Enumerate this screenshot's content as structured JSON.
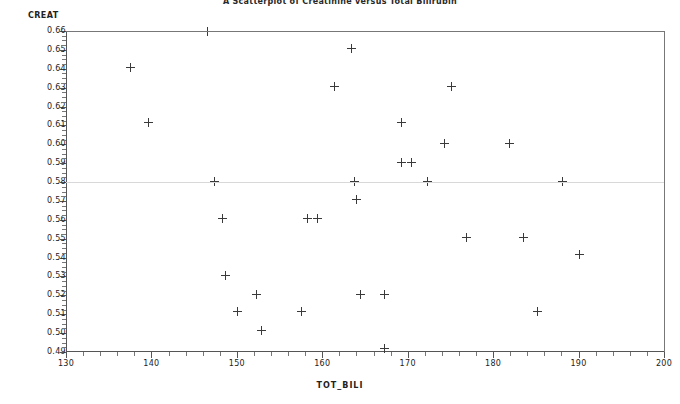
{
  "chart_data": {
    "type": "scatter",
    "title": "A Scatterplot of Creatinine versus Total Bilirubin",
    "xlabel": "TOT_BILI",
    "ylabel": "CREAT",
    "xlim": [
      130,
      200
    ],
    "ylim": [
      0.49,
      0.66
    ],
    "x_ticks": [
      130,
      140,
      150,
      160,
      170,
      180,
      190,
      200
    ],
    "x_tick_labels": [
      "130",
      "140",
      "150",
      "160",
      "170",
      "180",
      "190",
      "200"
    ],
    "x_minor_step": 2,
    "y_ticks": [
      0.49,
      0.5,
      0.51,
      0.52,
      0.53,
      0.54,
      0.55,
      0.56,
      0.57,
      0.58,
      0.59,
      0.6,
      0.61,
      0.62,
      0.63,
      0.64,
      0.65,
      0.66
    ],
    "y_tick_labels": [
      "0.49",
      "0.50",
      "0.51",
      "0.52",
      "0.53",
      "0.54",
      "0.55",
      "0.56",
      "0.57",
      "0.58",
      "0.59",
      "0.60",
      "0.61",
      "0.62",
      "0.63",
      "0.64",
      "0.65",
      "0.66"
    ],
    "y_minor_step": 0.0025,
    "grid": false,
    "legend": "none",
    "marker": "plus",
    "marker_color": "#3a3a3a",
    "reference_lines": [
      0.58
    ],
    "points": [
      {
        "x": 137.4,
        "y": 0.6405
      },
      {
        "x": 139.5,
        "y": 0.6115
      },
      {
        "x": 146.5,
        "y": 0.6598
      },
      {
        "x": 147.3,
        "y": 0.5805
      },
      {
        "x": 148.2,
        "y": 0.5605
      },
      {
        "x": 148.6,
        "y": 0.5305
      },
      {
        "x": 150.0,
        "y": 0.5115
      },
      {
        "x": 152.2,
        "y": 0.5205
      },
      {
        "x": 152.8,
        "y": 0.5015
      },
      {
        "x": 157.4,
        "y": 0.5115
      },
      {
        "x": 158.1,
        "y": 0.5605
      },
      {
        "x": 159.3,
        "y": 0.5605
      },
      {
        "x": 161.3,
        "y": 0.6305
      },
      {
        "x": 163.3,
        "y": 0.6505
      },
      {
        "x": 163.6,
        "y": 0.5805
      },
      {
        "x": 163.9,
        "y": 0.5705
      },
      {
        "x": 164.4,
        "y": 0.5205
      },
      {
        "x": 167.2,
        "y": 0.492
      },
      {
        "x": 167.2,
        "y": 0.5205
      },
      {
        "x": 169.1,
        "y": 0.6115
      },
      {
        "x": 169.2,
        "y": 0.5905
      },
      {
        "x": 170.3,
        "y": 0.5905
      },
      {
        "x": 172.2,
        "y": 0.5805
      },
      {
        "x": 174.2,
        "y": 0.6005
      },
      {
        "x": 175.0,
        "y": 0.6305
      },
      {
        "x": 176.8,
        "y": 0.5505
      },
      {
        "x": 181.8,
        "y": 0.6005
      },
      {
        "x": 183.4,
        "y": 0.5505
      },
      {
        "x": 185.1,
        "y": 0.5115
      },
      {
        "x": 188.0,
        "y": 0.5805
      },
      {
        "x": 190.0,
        "y": 0.5415
      }
    ]
  }
}
